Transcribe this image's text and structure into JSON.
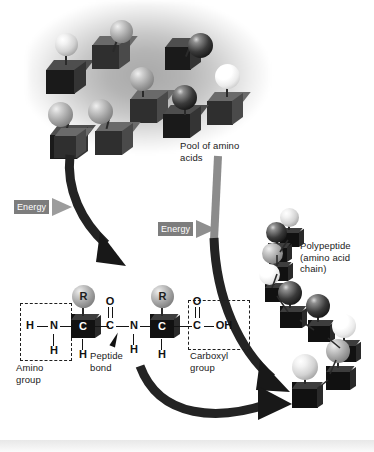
{
  "figure": {
    "background_color": "#ffffff"
  },
  "labels": {
    "pool": "Pool of amino\nacids",
    "polypeptide": "Polypeptide\n(amino acid\nchain)",
    "amino_group": "Amino\ngroup",
    "carboxyl_group": "Carboxyl\ngroup",
    "peptide_bond": "Peptide\nbond",
    "energy_left": "Energy",
    "energy_right": "Energy"
  },
  "colors": {
    "energy_tag_bg": "#7d7d7d",
    "energy_tag_text": "#ffffff",
    "cube_dark": "#1a1a1a",
    "arrow": "#1c1c1c",
    "text": "#1a1a1a"
  },
  "molecule": {
    "residue_1": {
      "amino_h_left": "H",
      "amino_n": "N",
      "amino_h_bottom": "H",
      "alpha_carbon": "C",
      "side_chain": "R",
      "alpha_h": "H",
      "carbonyl_o": "O",
      "carbonyl_c": "C"
    },
    "peptide_link": {
      "n": "N",
      "n_h": "H"
    },
    "residue_2": {
      "alpha_carbon": "C",
      "side_chain": "R",
      "alpha_h": "H",
      "carboxyl_o": "O",
      "carboxyl_c": "C",
      "carboxyl_oh": "OH"
    }
  },
  "pool_units": [
    {
      "ball": "light",
      "cube": "dark"
    },
    {
      "ball": "mid",
      "cube": "mid"
    },
    {
      "ball": "dark",
      "cube": "dark"
    },
    {
      "ball": "mid",
      "cube": "mid"
    },
    {
      "ball": "white",
      "cube": "mid"
    },
    {
      "ball": "mid",
      "cube": "dark"
    },
    {
      "ball": "mid",
      "cube": "mid"
    },
    {
      "ball": "dark",
      "cube": "dark"
    },
    {
      "ball": "mid",
      "cube": "mid"
    }
  ],
  "chain_units": [
    {
      "ball": "light"
    },
    {
      "ball": "dark"
    },
    {
      "ball": "mid"
    },
    {
      "ball": "white"
    },
    {
      "ball": "dark"
    },
    {
      "ball": "dark"
    },
    {
      "ball": "white"
    },
    {
      "ball": "light"
    }
  ]
}
